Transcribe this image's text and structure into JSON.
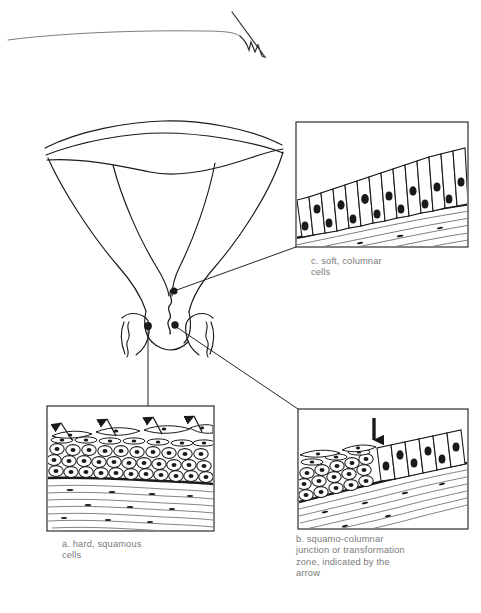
{
  "figure": {
    "background_color": "#ffffff",
    "ink_color": "#1a1a1a",
    "caption_color": "#7a7a7a"
  },
  "panels": [
    {
      "id": "c",
      "name": "soft-columnar-cells",
      "caption": "c. soft, columnar\n    cells",
      "epithelium": "columnar",
      "cell_layers": 1,
      "description": "tall columnar cells with oval nuclei over fibrous stroma"
    },
    {
      "id": "a",
      "name": "hard-squamous-cells",
      "caption": "a. hard, squamous\n    cells",
      "epithelium": "stratified squamous",
      "cell_layers": 4,
      "arrow_count": 4,
      "description": "flattened surface cells shedding upward, rounded basal layers"
    },
    {
      "id": "b",
      "name": "squamo-columnar-junction",
      "caption": "b. squamo-columnar\n    junction or transformation\n    zone, indicated by the\n    arrow",
      "epithelium": "squamous meeting columnar",
      "arrow_count": 1,
      "description": "junction marked by a single downward arrow"
    }
  ],
  "markers": [
    {
      "name": "marker-endocervix",
      "links_to": "c"
    },
    {
      "name": "marker-ectocervix",
      "links_to": "a"
    },
    {
      "name": "marker-os",
      "links_to": "b"
    }
  ],
  "anatomy": {
    "name": "uterus-cervix-cross-section",
    "parts": [
      "uterine fundus",
      "uterine cavity",
      "cervical canal",
      "external os",
      "vaginal fornix"
    ]
  }
}
